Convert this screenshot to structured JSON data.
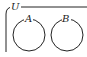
{
  "diagram": {
    "type": "venn",
    "universal_set": {
      "label": "U"
    },
    "sets": [
      {
        "label": "A",
        "cx": 29,
        "cy": 35,
        "r": 16
      },
      {
        "label": "B",
        "cx": 67,
        "cy": 35,
        "r": 16
      }
    ],
    "relationship": "disjoint",
    "stroke_color": "#222222"
  }
}
